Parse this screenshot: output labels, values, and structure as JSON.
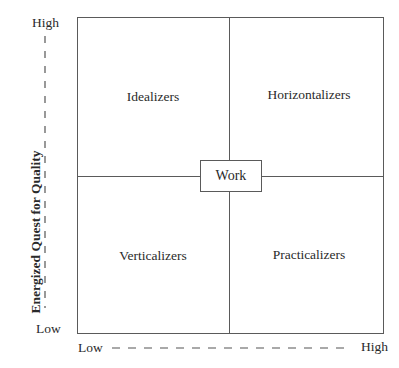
{
  "diagram": {
    "quadrants": {
      "top_left": "Idealizers",
      "top_right": "Horizontalizers",
      "bottom_left": "Verticalizers",
      "bottom_right": "Practicalizers"
    },
    "center_label": "Work",
    "y_axis": {
      "label": "Energized Quest for Quality",
      "high": "High",
      "low": "Low"
    },
    "x_axis": {
      "label": "",
      "low": "Low",
      "high": "High"
    },
    "colors": {
      "line": "#5a5a5a",
      "text": "#2a2a2a"
    }
  }
}
